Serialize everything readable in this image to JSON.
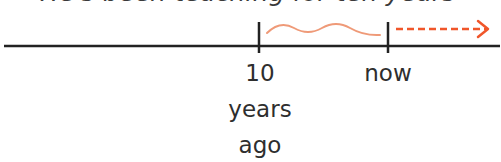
{
  "caption": "He's been teaching for ten years",
  "timeline": {
    "markers": [
      {
        "id": "past",
        "lines": [
          "10",
          "years",
          "ago"
        ],
        "x": 259
      },
      {
        "id": "now",
        "lines": [
          "now"
        ],
        "x": 388
      }
    ],
    "duration_wave": {
      "from_x": 267,
      "to_x": 380,
      "color": "#ef9a78"
    },
    "continuation_arrow": {
      "from_x": 396,
      "to_x": 490,
      "style": "dashed",
      "color": "#f0562a"
    },
    "axis_color": "#222222"
  }
}
